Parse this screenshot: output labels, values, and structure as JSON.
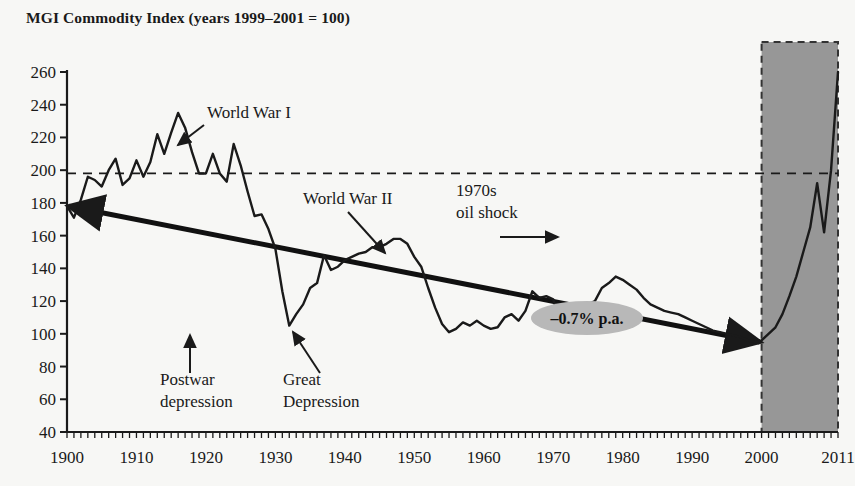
{
  "chart_data": {
    "type": "line",
    "title": "MGI Commodity Index (years 1999–2001 = 100)",
    "xlabel": "",
    "ylabel": "",
    "xlim": [
      1900,
      2011
    ],
    "ylim": [
      40,
      260
    ],
    "ytick_step": 20,
    "yticks": [
      40,
      60,
      80,
      100,
      120,
      140,
      160,
      180,
      200,
      220,
      240,
      260
    ],
    "xticks": [
      1900,
      1910,
      1920,
      1930,
      1940,
      1950,
      1960,
      1970,
      1980,
      1990,
      2000,
      2011
    ],
    "xtick_labels": [
      "1900",
      "1910",
      "1920",
      "1930",
      "1940",
      "1950",
      "1960",
      "1970",
      "1980",
      "1990",
      "2000",
      "2011"
    ],
    "ytick_labels": [
      "40",
      "60",
      "80",
      "100",
      "120",
      "140",
      "160",
      "180",
      "200",
      "220",
      "240",
      "260"
    ],
    "grid": false,
    "legend": "none",
    "series": [
      {
        "name": "MGI Commodity Index",
        "color": "#1a1a1a",
        "x": [
          1900,
          1901,
          1902,
          1903,
          1904,
          1905,
          1906,
          1907,
          1908,
          1909,
          1910,
          1911,
          1912,
          1913,
          1914,
          1915,
          1916,
          1917,
          1918,
          1919,
          1920,
          1921,
          1922,
          1923,
          1924,
          1925,
          1926,
          1927,
          1928,
          1929,
          1930,
          1931,
          1932,
          1933,
          1934,
          1935,
          1936,
          1937,
          1938,
          1939,
          1940,
          1941,
          1942,
          1943,
          1944,
          1945,
          1946,
          1947,
          1948,
          1949,
          1950,
          1951,
          1952,
          1953,
          1954,
          1955,
          1956,
          1957,
          1958,
          1959,
          1960,
          1961,
          1962,
          1963,
          1964,
          1965,
          1966,
          1967,
          1968,
          1969,
          1970,
          1971,
          1972,
          1973,
          1974,
          1975,
          1976,
          1977,
          1978,
          1979,
          1980,
          1981,
          1982,
          1983,
          1984,
          1985,
          1986,
          1987,
          1988,
          1989,
          1990,
          1991,
          1992,
          1993,
          1994,
          1995,
          1996,
          1997,
          1998,
          1999,
          2000,
          2001,
          2002,
          2003,
          2004,
          2005,
          2006,
          2007,
          2008,
          2009,
          2010,
          2011
        ],
        "y": [
          178,
          171,
          182,
          196,
          194,
          190,
          200,
          207,
          191,
          195,
          206,
          196,
          205,
          222,
          210,
          223,
          235,
          226,
          211,
          198,
          198,
          210,
          198,
          193,
          216,
          203,
          187,
          172,
          173,
          164,
          152,
          126,
          105,
          112,
          118,
          128,
          131,
          148,
          139,
          141,
          145,
          147,
          149,
          150,
          153,
          153,
          155,
          158,
          158,
          155,
          147,
          141,
          128,
          116,
          106,
          101,
          103,
          107,
          105,
          108,
          105,
          103,
          104,
          110,
          112,
          108,
          114,
          126,
          122,
          123,
          121,
          108,
          104,
          106,
          112,
          118,
          120,
          128,
          131,
          135,
          133,
          130,
          127,
          122,
          118,
          116,
          114,
          113,
          112,
          110,
          108,
          106,
          104,
          102,
          101,
          100,
          99,
          98,
          96,
          95,
          96,
          100,
          104,
          112,
          123,
          135,
          150,
          165,
          192,
          162,
          200,
          260
        ],
        "note": "index values read from chart, base years 1999-2001 = 100"
      }
    ],
    "reference_lines": [
      {
        "name": "dashed-level",
        "orientation": "horizontal",
        "value": 198,
        "style": "dashed",
        "color": "#1a1a1a"
      }
    ],
    "trend_line": {
      "name": "long-run-trend",
      "label": "–0.7% p.a.",
      "from": {
        "x": 1900,
        "y": 178
      },
      "to": {
        "x": 2000,
        "y": 95
      },
      "arrowheads": "both",
      "color": "#111111",
      "label_bg": "#b8b8b8"
    },
    "shaded_region": {
      "name": "commodity-price-reversal",
      "x_start": 2000,
      "x_end": 2011,
      "fill": "#979797",
      "border": "dashed",
      "border_color": "#333333"
    },
    "annotations": [
      {
        "id": "ww1",
        "text": "World War I",
        "text_x": 207,
        "text_y": 118,
        "arrow_from": [
          204,
          125
        ],
        "arrow_to": [
          178,
          145
        ]
      },
      {
        "id": "ww2",
        "text": "World War II",
        "text_x": 303,
        "text_y": 204,
        "arrow_from": [
          348,
          212
        ],
        "arrow_to": [
          385,
          253
        ]
      },
      {
        "id": "oil-shock",
        "text_line1": "1970s",
        "text_line2": "oil shock",
        "text_x": 456,
        "text_y": 196,
        "arrow_from": [
          500,
          237
        ],
        "arrow_to": [
          558,
          237
        ]
      },
      {
        "id": "postwar",
        "text_line1": "Postwar",
        "text_line2": "depression",
        "text_x": 160,
        "text_y": 385,
        "arrow_from": [
          190,
          373
        ],
        "arrow_to": [
          190,
          335
        ]
      },
      {
        "id": "great-depression",
        "text_line1": "Great",
        "text_line2": "Depression",
        "text_x": 283,
        "text_y": 385,
        "arrow_from": [
          320,
          373
        ],
        "arrow_to": [
          293,
          332
        ]
      }
    ]
  },
  "annotations_text": {
    "ww1": "World War I",
    "ww2": "World War II",
    "oil_shock_l1": "1970s",
    "oil_shock_l2": "oil shock",
    "postwar_l1": "Postwar",
    "postwar_l2": "depression",
    "great_depression_l1": "Great",
    "great_depression_l2": "Depression",
    "trend": "–0.7% p.a."
  },
  "colors": {
    "background": "#f7f7f5",
    "ink": "#1a1a1a",
    "shade": "#979797",
    "label_bg": "#b8b8b8"
  }
}
